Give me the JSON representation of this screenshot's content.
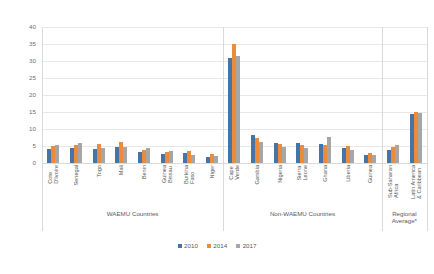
{
  "chart_data": {
    "type": "bar",
    "title": "",
    "xlabel": "",
    "ylabel": "",
    "ylim": [
      0,
      40
    ],
    "ytick_step": 5,
    "yticks": [
      "0",
      "5",
      "10",
      "15",
      "20",
      "25",
      "30",
      "35",
      "40"
    ],
    "grid": true,
    "legend_position": "bottom",
    "categories": [
      "Cote D'Ivoire",
      "Senegal",
      "Togo",
      "Mali",
      "Benin",
      "Guinea Bissau",
      "Burkina Faso",
      "Niger",
      "Cape Verde",
      "Gambia",
      "Nigeria",
      "Sierra Leone",
      "Ghana",
      "Liberia",
      "Guinea",
      "Sub-Saharan Africa",
      "Latin America & Caribbean"
    ],
    "category_lines": [
      [
        "Cote",
        "D'Ivoire"
      ],
      [
        "Senegal"
      ],
      [
        "Togo"
      ],
      [
        "Mali"
      ],
      [
        "Benin"
      ],
      [
        "Guinea",
        "Bissau"
      ],
      [
        "Burkina",
        "Faso"
      ],
      [
        "Niger"
      ],
      [
        "Cape",
        "Verde"
      ],
      [
        "Gambia"
      ],
      [
        "Nigeria"
      ],
      [
        "Sierra",
        "Leone"
      ],
      [
        "Ghana"
      ],
      [
        "Liberia"
      ],
      [
        "Guinea"
      ],
      [
        "Sub-Saharan",
        "Africa"
      ],
      [
        "Latin America",
        "& Caribbean"
      ]
    ],
    "series": [
      {
        "name": "2010",
        "color": "#4574a7",
        "values": [
          4.2,
          4.4,
          4.0,
          4.6,
          3.3,
          2.6,
          3.0,
          1.8,
          31.0,
          8.3,
          6.0,
          5.9,
          5.5,
          4.3,
          2.3,
          3.8,
          14.3
        ]
      },
      {
        "name": "2014",
        "color": "#ec8b3c",
        "values": [
          4.9,
          5.2,
          5.6,
          6.2,
          3.7,
          3.3,
          3.5,
          2.6,
          35.0,
          7.5,
          5.5,
          5.3,
          5.2,
          4.9,
          2.9,
          4.6,
          14.9
        ]
      },
      {
        "name": "2017",
        "color": "#a6a6a6",
        "values": [
          5.4,
          5.8,
          4.4,
          4.6,
          4.5,
          3.6,
          2.3,
          2.0,
          31.5,
          6.3,
          4.6,
          4.3,
          7.7,
          3.7,
          2.5,
          5.3,
          14.6
        ]
      }
    ],
    "groups": [
      {
        "label": "WAEMU Countries",
        "start": 0,
        "end": 7,
        "lines": [
          "WAEMU Countries"
        ]
      },
      {
        "label": "Non-WAEMU Countries",
        "start": 8,
        "end": 14,
        "lines": [
          "Non-WAEMU Countries"
        ]
      },
      {
        "label": "Regional Average*",
        "start": 15,
        "end": 16,
        "lines": [
          "Regional",
          "Average*"
        ]
      }
    ],
    "legend": [
      {
        "label": "2010",
        "color": "#4574a7"
      },
      {
        "label": "2014",
        "color": "#ec8b3c"
      },
      {
        "label": "2017",
        "color": "#a6a6a6"
      }
    ]
  }
}
